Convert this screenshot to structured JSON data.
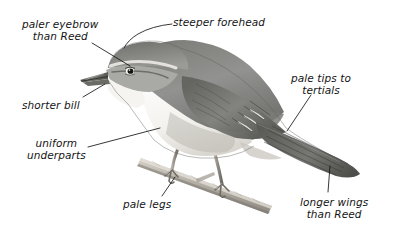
{
  "figure": {
    "background_color": "#ffffff",
    "ink_color": "#141414",
    "width": 393,
    "height": 235
  },
  "subject": {
    "name": "warbler",
    "pose": "perched on a diagonal twig, facing left",
    "medium": "graphite pencil drawing",
    "upperparts_color": "#8b8b88",
    "underparts_color": "#f2f0ec",
    "branch_color": "#b9b4ab"
  },
  "annotations": [
    {
      "id": "paler-eyebrow",
      "lines": [
        "paler eyebrow",
        "than Reed"
      ],
      "text": "paler eyebrow\nthan Reed",
      "align": "center",
      "x": 22,
      "y": 18
    },
    {
      "id": "steeper-forehead",
      "lines": [
        "steeper forehead"
      ],
      "text": "steeper forehead",
      "align": "left",
      "x": 173,
      "y": 16
    },
    {
      "id": "shorter-bill",
      "lines": [
        "shorter bill"
      ],
      "text": "shorter bill",
      "align": "left",
      "x": 22,
      "y": 99
    },
    {
      "id": "pale-tips-to-tertials",
      "lines": [
        "pale tips to",
        "tertials"
      ],
      "text": "pale tips to\ntertials",
      "align": "center",
      "x": 291,
      "y": 72
    },
    {
      "id": "uniform-underparts",
      "lines": [
        "uniform",
        "underparts"
      ],
      "text": "uniform\nunderparts",
      "align": "center",
      "x": 27,
      "y": 137
    },
    {
      "id": "pale-legs",
      "lines": [
        "pale legs"
      ],
      "text": "pale legs",
      "align": "left",
      "x": 123,
      "y": 198
    },
    {
      "id": "longer-wings",
      "lines": [
        "longer wings",
        "than Reed"
      ],
      "text": "longer wings\nthan Reed",
      "align": "center",
      "x": 300,
      "y": 196
    }
  ]
}
